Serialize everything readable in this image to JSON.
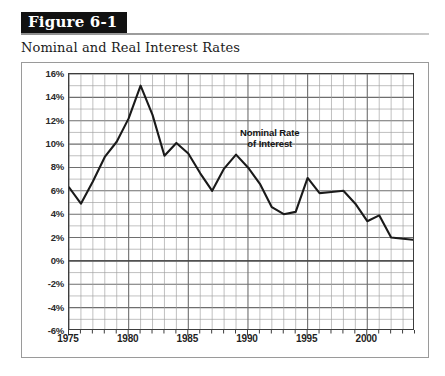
{
  "figure": {
    "banner_label": "Figure 6-1",
    "subtitle": "Nominal and Real Interest Rates"
  },
  "colors": {
    "banner_background": "#111111",
    "banner_text": "#ffffff",
    "series_line": "#1a1a1a",
    "major_gridline": "#6e6e6e",
    "minor_gridline": "#9e9e9e",
    "plot_border": "#3d3d3d",
    "card_border": "#9a9a9a"
  },
  "chart_data": {
    "type": "line",
    "title": "Nominal and Real Interest Rates",
    "xlabel": "",
    "ylabel": "",
    "xlim": [
      1975,
      2004
    ],
    "ylim": [
      -6,
      16
    ],
    "y_tick_step": 2,
    "y_minor_step": 1,
    "x_tick_step": 5,
    "x_minor_step": 1,
    "grid": true,
    "legend": false,
    "y_tick_labels": [
      "16%",
      "14%",
      "12%",
      "10%",
      "8%",
      "6%",
      "4%",
      "2%",
      "0%",
      "-2%",
      "-4%",
      "-6%"
    ],
    "y_tick_values": [
      16,
      14,
      12,
      10,
      8,
      6,
      4,
      2,
      0,
      -2,
      -4,
      -6
    ],
    "x_tick_labels": [
      "1975",
      "1980",
      "1985",
      "1990",
      "1995",
      "2000"
    ],
    "x_tick_values": [
      1975,
      1980,
      1985,
      1990,
      1995,
      2000
    ],
    "x": [
      1975,
      1976,
      1977,
      1978,
      1979,
      1980,
      1981,
      1982,
      1983,
      1984,
      1985,
      1986,
      1987,
      1988,
      1989,
      1990,
      1991,
      1992,
      1993,
      1994,
      1995,
      1996,
      1997,
      1998,
      1999,
      2000,
      2001,
      2002,
      2003,
      2004
    ],
    "series": [
      {
        "name": "Nominal Rate of Interest",
        "values": [
          6.3,
          4.9,
          6.8,
          8.9,
          10.2,
          12.2,
          15.0,
          12.5,
          9.0,
          10.1,
          9.2,
          7.5,
          6.0,
          7.9,
          9.1,
          8.0,
          6.6,
          4.6,
          4.0,
          4.2,
          7.1,
          5.8,
          5.9,
          6.0,
          4.9,
          3.4,
          3.9,
          2.0,
          1.9,
          1.8
        ]
      }
    ],
    "annotations": [
      {
        "id": "nominal-rate-annotation",
        "line1": "Nominal Rate",
        "line2": "of Interest",
        "near_x": 1989,
        "near_y": 11.5
      }
    ]
  }
}
